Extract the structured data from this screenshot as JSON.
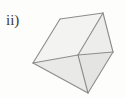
{
  "figure": {
    "label": "ii)",
    "caption_present": false,
    "background_color": "#fdfdfc",
    "solid": {
      "name": "triangular-prism",
      "edge_color": "#8c8c8c",
      "edge_width": 1.1,
      "vertices": {
        "top_back_left": [
          60,
          19
        ],
        "top_apex_right": [
          103,
          13
        ],
        "left": [
          33,
          63
        ],
        "center": [
          78,
          55
        ],
        "bottom": [
          88,
          93
        ],
        "right": [
          113,
          52
        ]
      },
      "faces": [
        {
          "name": "top-face",
          "points": "60,19 103,13 78,55 33,63",
          "fill": "#f3f3f2"
        },
        {
          "name": "front-left-face",
          "points": "33,63 78,55 88,93",
          "fill": "#e9e9e8"
        },
        {
          "name": "front-right-face",
          "points": "78,55 113,52 88,93",
          "fill": "#e4e4e3"
        },
        {
          "name": "right-end-face",
          "points": "103,13 113,52 78,55",
          "fill": "#ededec"
        }
      ],
      "edges": [
        {
          "name": "edge-top-back",
          "from": [
            60,
            19
          ],
          "to": [
            103,
            13
          ]
        },
        {
          "name": "edge-top-left",
          "from": [
            33,
            63
          ],
          "to": [
            60,
            19
          ]
        },
        {
          "name": "edge-top-front",
          "from": [
            33,
            63
          ],
          "to": [
            78,
            55
          ]
        },
        {
          "name": "edge-ridge-right",
          "from": [
            78,
            55
          ],
          "to": [
            103,
            13
          ]
        },
        {
          "name": "edge-right-back",
          "from": [
            103,
            13
          ],
          "to": [
            113,
            52
          ]
        },
        {
          "name": "edge-right-side",
          "from": [
            113,
            52
          ],
          "to": [
            78,
            55
          ]
        },
        {
          "name": "edge-left-bottom",
          "from": [
            33,
            63
          ],
          "to": [
            88,
            93
          ]
        },
        {
          "name": "edge-center-bottom",
          "from": [
            78,
            55
          ],
          "to": [
            88,
            93
          ]
        },
        {
          "name": "edge-right-bottom",
          "from": [
            113,
            52
          ],
          "to": [
            88,
            93
          ]
        }
      ]
    }
  }
}
